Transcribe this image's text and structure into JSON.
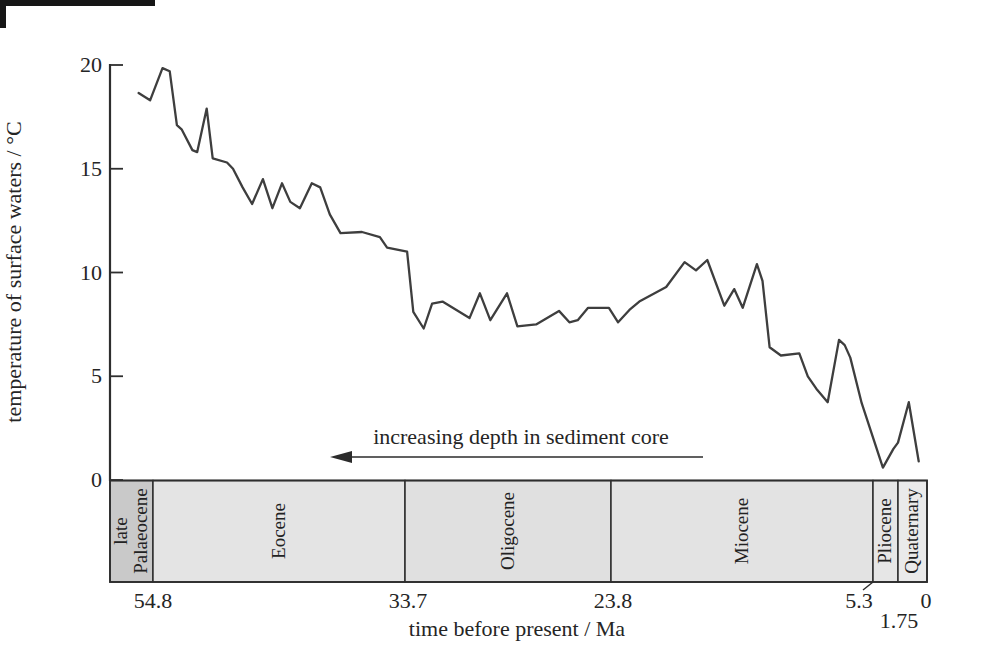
{
  "figure": {
    "background_color": "#ffffff",
    "line_color": "#3e3e3e",
    "axis_color": "#2e2e2e",
    "text_color": "#252525",
    "scan_artifact": "small dark mark in extreme top-left corner of scanned page"
  },
  "chart_data": {
    "type": "line",
    "title": "",
    "ylabel": "temperature of surface waters / °C",
    "xlabel": "time before present / Ma",
    "ylim": [
      0,
      20
    ],
    "y_ticks": [
      20,
      15,
      10,
      5,
      0
    ],
    "x_axis_note": "x axis reversed (older at left); spacing non-linear, proportional to depth in sediment core",
    "x_anchors": [
      {
        "ma": 57.8,
        "frac": 0.0
      },
      {
        "ma": 54.8,
        "frac": 0.0526
      },
      {
        "ma": 33.7,
        "frac": 0.3611
      },
      {
        "ma": 23.8,
        "frac": 0.6132
      },
      {
        "ma": 5.3,
        "frac": 0.9339
      },
      {
        "ma": 1.75,
        "frac": 0.9645
      },
      {
        "ma": 0.0,
        "frac": 1.0
      }
    ],
    "x_tick_labels": [
      {
        "text": "54.8",
        "ma": 54.8,
        "dx": 0,
        "row": 1
      },
      {
        "text": "33.7",
        "ma": 33.7,
        "dx": 3,
        "row": 1
      },
      {
        "text": "23.8",
        "ma": 23.8,
        "dx": 2,
        "row": 1
      },
      {
        "text": "5.3",
        "ma": 5.3,
        "dx": -14,
        "row": 1
      },
      {
        "text": "1.75",
        "ma": 1.75,
        "dx": 1,
        "row": 2
      },
      {
        "text": "0",
        "ma": 0.0,
        "dx": -1,
        "row": 1
      }
    ],
    "annotation": {
      "text": "increasing depth in sediment core",
      "arrow_direction": "left",
      "arrow_from_ma": 33.8,
      "arrow_to_ma": 17.2
    },
    "epochs": [
      {
        "label": "late\nPalaeocene",
        "name": "late Palaeocene",
        "from_ma": 57.8,
        "to_ma": 54.8,
        "color": "#c9c9c9"
      },
      {
        "label": "Eocene",
        "name": "Eocene",
        "from_ma": 54.8,
        "to_ma": 33.7,
        "color": "#e4e4e4"
      },
      {
        "label": "Oligocene",
        "name": "Oligocene",
        "from_ma": 33.7,
        "to_ma": 23.8,
        "color": "#e0e0e0"
      },
      {
        "label": "Miocene",
        "name": "Miocene",
        "from_ma": 23.8,
        "to_ma": 5.3,
        "color": "#e3e3e3"
      },
      {
        "label": "Pliocene",
        "name": "Pliocene",
        "from_ma": 5.3,
        "to_ma": 1.75,
        "color": "#e6e6e6"
      },
      {
        "label": "Quaternary",
        "name": "Quaternary",
        "from_ma": 1.75,
        "to_ma": 0.0,
        "color": "#eaeaea"
      }
    ],
    "series": [
      {
        "name": "surface water temperature from sediment core",
        "points_ma_degC": [
          [
            55.8,
            18.65
          ],
          [
            55.0,
            18.3
          ],
          [
            54.0,
            19.85
          ],
          [
            53.4,
            19.7
          ],
          [
            52.8,
            17.1
          ],
          [
            52.4,
            16.9
          ],
          [
            51.5,
            15.9
          ],
          [
            51.1,
            15.8
          ],
          [
            50.3,
            17.9
          ],
          [
            49.8,
            15.5
          ],
          [
            48.6,
            15.3
          ],
          [
            48.1,
            15.0
          ],
          [
            47.3,
            14.1
          ],
          [
            46.5,
            13.3
          ],
          [
            45.6,
            14.5
          ],
          [
            44.8,
            13.1
          ],
          [
            44.0,
            14.3
          ],
          [
            43.3,
            13.4
          ],
          [
            42.5,
            13.1
          ],
          [
            41.5,
            14.3
          ],
          [
            40.8,
            14.1
          ],
          [
            40.0,
            12.8
          ],
          [
            39.1,
            11.9
          ],
          [
            37.3,
            11.95
          ],
          [
            35.8,
            11.7
          ],
          [
            35.2,
            11.2
          ],
          [
            33.6,
            11.0
          ],
          [
            33.3,
            8.1
          ],
          [
            32.8,
            7.3
          ],
          [
            32.4,
            8.5
          ],
          [
            31.9,
            8.6
          ],
          [
            30.6,
            7.8
          ],
          [
            30.1,
            9.0
          ],
          [
            29.6,
            7.7
          ],
          [
            28.8,
            9.0
          ],
          [
            28.3,
            7.4
          ],
          [
            27.4,
            7.5
          ],
          [
            26.3,
            8.15
          ],
          [
            25.8,
            7.6
          ],
          [
            25.4,
            7.7
          ],
          [
            24.9,
            8.3
          ],
          [
            23.9,
            8.3
          ],
          [
            23.3,
            7.6
          ],
          [
            22.5,
            8.2
          ],
          [
            21.8,
            8.6
          ],
          [
            19.9,
            9.3
          ],
          [
            18.6,
            10.5
          ],
          [
            17.8,
            10.1
          ],
          [
            17.0,
            10.6
          ],
          [
            15.8,
            8.4
          ],
          [
            15.1,
            9.2
          ],
          [
            14.5,
            8.3
          ],
          [
            13.5,
            10.4
          ],
          [
            13.1,
            9.6
          ],
          [
            12.6,
            6.4
          ],
          [
            11.8,
            6.0
          ],
          [
            10.5,
            6.1
          ],
          [
            9.9,
            5.0
          ],
          [
            9.3,
            4.4
          ],
          [
            8.5,
            3.75
          ],
          [
            7.7,
            6.75
          ],
          [
            7.3,
            6.5
          ],
          [
            6.9,
            5.9
          ],
          [
            6.1,
            3.7
          ],
          [
            3.9,
            0.6
          ],
          [
            2.4,
            1.5
          ],
          [
            1.75,
            1.8
          ],
          [
            1.1,
            3.75
          ],
          [
            0.5,
            0.9
          ]
        ]
      }
    ],
    "legend": null,
    "grid": false
  }
}
